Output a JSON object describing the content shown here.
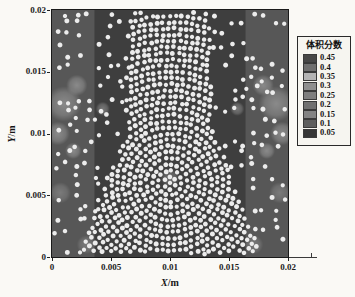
{
  "figure": {
    "background": "#faf9f5"
  },
  "axes": {
    "x": {
      "var": "X",
      "unit": "/m",
      "tick_labels": [
        "0",
        "0.005",
        "0.01",
        "0.015",
        "0.02"
      ]
    },
    "y": {
      "var": "Y",
      "unit": "/m",
      "tick_labels": [
        "0",
        "0.005",
        "0.01",
        "0.015",
        "0.02"
      ]
    }
  },
  "chart_data": {
    "type": "scatter",
    "title": "",
    "xlabel": "X/m",
    "ylabel": "Y/m",
    "xlim": [
      0,
      0.02
    ],
    "ylim": [
      0,
      0.02
    ],
    "xticks": [
      0,
      0.005,
      0.01,
      0.015,
      0.02
    ],
    "yticks": [
      0,
      0.005,
      0.01,
      0.015,
      0.02
    ],
    "grid": false,
    "legend": {
      "title": "体积分数",
      "position": "right",
      "levels": [
        "0.45",
        "0.4",
        "0.35",
        "0.3",
        "0.25",
        "0.2",
        "0.15",
        "0.1",
        "0.05"
      ],
      "colors": [
        "#474747",
        "#6f6f6f",
        "#b4b4b4",
        "#8f8f8f",
        "#7e7e7e",
        "#707070",
        "#838383",
        "#5e5e5e",
        "#353535"
      ]
    },
    "field": {
      "description": "grayscale volume-fraction contour field behind particles",
      "base_color": "#3e3e3e",
      "base_level": 0.05,
      "side_strip_color": "#575757",
      "side_strip_width_m": 0.0036,
      "blobs": [
        {
          "x": 0.001,
          "y": 0.0124,
          "r": 0.0015,
          "color": "#8f8f8f"
        },
        {
          "x": 0.0005,
          "y": 0.01,
          "r": 0.001,
          "color": "#8f8f8f"
        },
        {
          "x": 0.0021,
          "y": 0.0139,
          "r": 0.0009,
          "color": "#8f8f8f"
        },
        {
          "x": 0.0043,
          "y": 0.012,
          "r": 0.0006,
          "color": "#7e7e7e"
        },
        {
          "x": 0.0007,
          "y": 0.0052,
          "r": 0.0009,
          "color": "#7e7e7e"
        },
        {
          "x": 0.0029,
          "y": 0.001,
          "r": 0.0008,
          "color": "#7e7e7e"
        },
        {
          "x": 0.0018,
          "y": 0.0086,
          "r": 0.0007,
          "color": "#8f8f8f"
        },
        {
          "x": 0.019,
          "y": 0.0124,
          "r": 0.0015,
          "color": "#8f8f8f"
        },
        {
          "x": 0.0195,
          "y": 0.01,
          "r": 0.001,
          "color": "#8f8f8f"
        },
        {
          "x": 0.0179,
          "y": 0.0139,
          "r": 0.0009,
          "color": "#8f8f8f"
        },
        {
          "x": 0.0157,
          "y": 0.012,
          "r": 0.0006,
          "color": "#7e7e7e"
        },
        {
          "x": 0.0193,
          "y": 0.0052,
          "r": 0.0009,
          "color": "#7e7e7e"
        },
        {
          "x": 0.0171,
          "y": 0.001,
          "r": 0.0008,
          "color": "#7e7e7e"
        },
        {
          "x": 0.0182,
          "y": 0.0086,
          "r": 0.0007,
          "color": "#8f8f8f"
        },
        {
          "x": 0.01,
          "y": 0.0064,
          "r": 0.0008,
          "color": "#757575"
        }
      ]
    },
    "particles": {
      "color": "#ececec",
      "radius_m": 0.000195,
      "seed": 1337,
      "dense_region": {
        "pattern": "concentric-rings",
        "ring_center": [
          0.01,
          0.006
        ],
        "ring_spacing_m": 0.0005,
        "polygon": [
          [
            0.0022,
            0.0
          ],
          [
            0.0178,
            0.0
          ],
          [
            0.0136,
            0.0102
          ],
          [
            0.0133,
            0.02
          ],
          [
            0.0067,
            0.02
          ],
          [
            0.0064,
            0.0102
          ]
        ]
      },
      "sparse_region": {
        "pattern": "jittered-grid",
        "grid_spacing_m": 0.00088,
        "jitter_m": 0.0003,
        "keep_probability": 0.62
      }
    }
  }
}
